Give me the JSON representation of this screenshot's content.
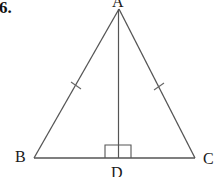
{
  "problem": {
    "number": "6."
  },
  "figure": {
    "type": "isosceles-triangle-with-altitude",
    "vertices": {
      "A": {
        "label": "A",
        "x": 119,
        "y": 9
      },
      "B": {
        "label": "B",
        "x": 34,
        "y": 158
      },
      "C": {
        "label": "C",
        "x": 195,
        "y": 158
      },
      "D": {
        "label": "D",
        "x": 118,
        "y": 158
      }
    },
    "segments": [
      "AB",
      "AC",
      "BC",
      "AD"
    ],
    "congruent_marks": [
      "AB",
      "AC"
    ],
    "right_angle_at": "D",
    "stroke_color": "#555555",
    "label_color": "#1a1a1a"
  }
}
